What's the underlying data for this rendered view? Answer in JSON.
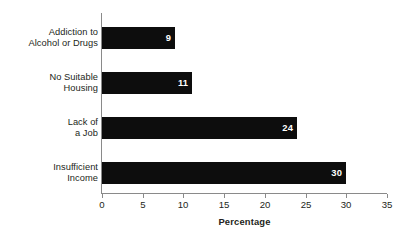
{
  "chart_data": {
    "type": "bar",
    "orientation": "horizontal",
    "title": "",
    "xlabel": "Percentage",
    "ylabel": "",
    "xlim": [
      0,
      35
    ],
    "xticks": [
      0,
      5,
      10,
      15,
      20,
      25,
      30,
      35
    ],
    "xtick_labels": [
      "0",
      "5",
      "10",
      "15",
      "20",
      "25",
      "30",
      "35"
    ],
    "grid": false,
    "legend": false,
    "bar_color": "#0d0d0d",
    "value_label_color": "#ffffff",
    "axis_color": "#8a8a8a",
    "text_color": "#231f20",
    "categories": [
      "Addiction to Alcohol or Drugs",
      "No Suitable Housing",
      "Lack of a Job",
      "Insufficient Income"
    ],
    "category_lines": [
      [
        "Addiction to",
        "Alcohol or Drugs"
      ],
      [
        "No Suitable",
        "Housing"
      ],
      [
        "Lack of",
        "a Job"
      ],
      [
        "Insufficient",
        "Income"
      ]
    ],
    "values": [
      9,
      11,
      24,
      30
    ],
    "value_labels": [
      "9",
      "11",
      "24",
      "30"
    ]
  }
}
